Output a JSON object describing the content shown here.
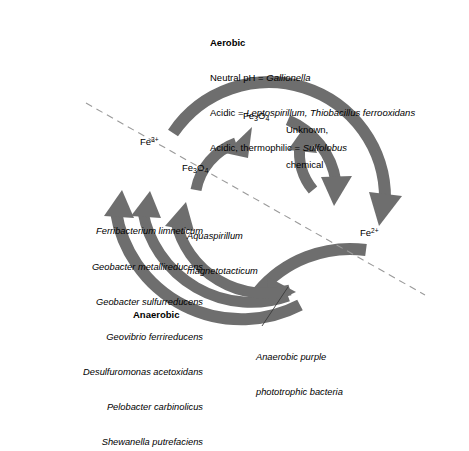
{
  "diagram": {
    "title_block": {
      "heading": "Aerobic",
      "lines": [
        {
          "prefix": "Neutral pH = ",
          "organisms": "Gallionella"
        },
        {
          "prefix": "Acidic  = ",
          "organisms": "Leptospirillum, Thiobacillus ferrooxidans"
        },
        {
          "prefix": "Acidic, thermophilic = ",
          "organisms": "Sulfolobus"
        }
      ]
    },
    "anaerobic_label": "Anaerobic",
    "species_list": [
      "Ferribacterium limneticum",
      "Geobacter metallireducens",
      "Geobacter sulfurreducens",
      "Geovibrio ferrireducens",
      "Desulfuromonas acetoxidans",
      "Pelobacter carbinolicus",
      "Shewanella putrefaciens"
    ],
    "chem": {
      "ferric": {
        "element": "Fe",
        "charge": "3+"
      },
      "ferrous": {
        "element": "Fe",
        "charge": "2+"
      },
      "magnetite": {
        "element": "Fe",
        "sub": "3",
        "oxide": "O",
        "oxide_sub": "4"
      }
    },
    "annotations": {
      "unknown_chemical": [
        "Unknown,",
        "chemical"
      ],
      "aquaspirillum": [
        "Aquaspirillum",
        "magnetotacticum"
      ],
      "purple_bacteria": [
        "Anaerobic purple",
        "phototrophic bacteria"
      ]
    },
    "colors": {
      "arrow_gray": "#6e6e6e",
      "dash_gray": "#9a9a9a",
      "text": "#000000",
      "background": "#ffffff"
    }
  }
}
